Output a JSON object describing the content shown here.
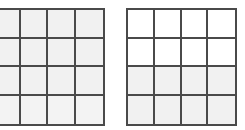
{
  "grids": [
    {
      "id": "left",
      "rows": 4,
      "cols": 4,
      "line_color": "#4a4a4a",
      "row_fills": [
        "#f1f1f1",
        "#f1f1f1",
        "#f1f1f1",
        "#f3f3f3"
      ]
    },
    {
      "id": "right",
      "rows": 4,
      "cols": 4,
      "line_color": "#4a4a4a",
      "row_fills": [
        "#ffffff",
        "#ffffff",
        "#f1f1f1",
        "#f1f1f1"
      ]
    }
  ]
}
